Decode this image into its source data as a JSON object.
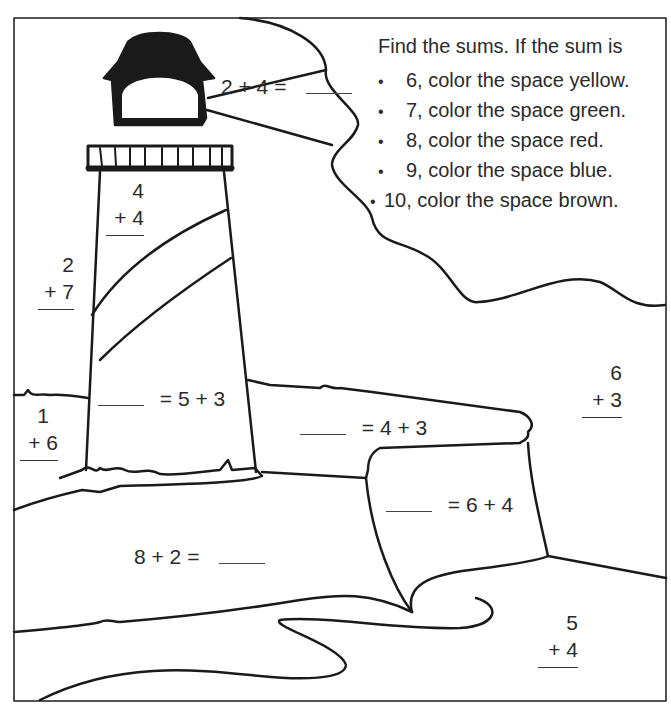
{
  "instructions": {
    "title": "Find the sums. If the sum is",
    "bullet": "•",
    "items": [
      {
        "label": "6, color the space yellow.",
        "sum": 6,
        "color": "yellow"
      },
      {
        "label": "7, color the space green.",
        "sum": 7,
        "color": "green"
      },
      {
        "label": "8, color the space red.",
        "sum": 8,
        "color": "red"
      },
      {
        "label": "9, color the space blue.",
        "sum": 9,
        "color": "blue"
      },
      {
        "label": "10, color the space brown.",
        "sum": 10,
        "color": "brown"
      }
    ]
  },
  "problems": {
    "beam": {
      "left": "2 + 4 =",
      "answer": ""
    },
    "tower_top": {
      "top": "4",
      "bottom": "+ 4"
    },
    "left_sky": {
      "top": "2",
      "bottom": "+ 7"
    },
    "left_grass": {
      "top": "1",
      "bottom": "+ 6"
    },
    "tower_base": {
      "right": "= 5 + 3",
      "answer": ""
    },
    "cliff_top": {
      "right": "= 4 + 3",
      "answer": ""
    },
    "cliff_face": {
      "right": "= 6 + 4",
      "answer": ""
    },
    "beach": {
      "left": "8 + 2 =",
      "answer": ""
    },
    "right_sky": {
      "top": "6",
      "bottom": "+ 3"
    },
    "sea": {
      "top": "5",
      "bottom": "+ 4"
    }
  }
}
